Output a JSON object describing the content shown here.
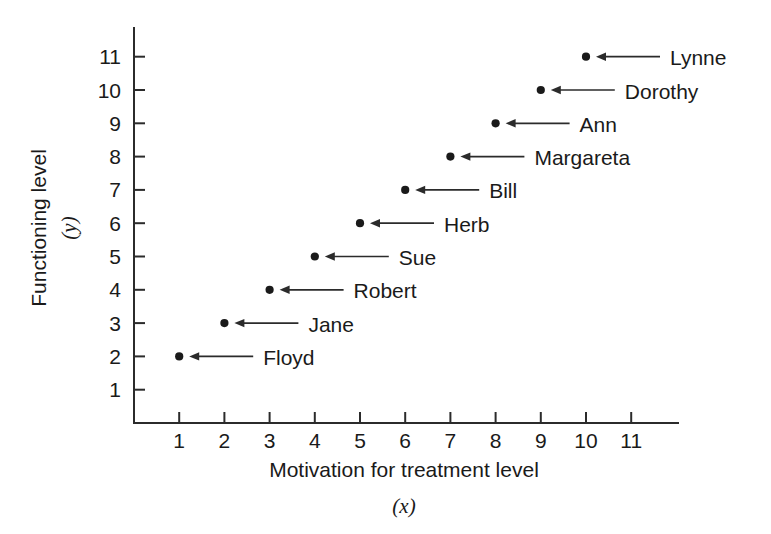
{
  "chart_data": {
    "type": "scatter",
    "title": "",
    "xlabel": "Motivation for treatment level",
    "xvar": "(x)",
    "ylabel": "Functioning level",
    "yvar": "(y)",
    "xlim": [
      0,
      11.8
    ],
    "ylim": [
      0,
      11.7
    ],
    "grid": false,
    "legend": "none",
    "xticks": [
      "1",
      "2",
      "3",
      "4",
      "5",
      "6",
      "7",
      "8",
      "9",
      "10",
      "11"
    ],
    "yticks": [
      "1",
      "2",
      "3",
      "4",
      "5",
      "6",
      "7",
      "8",
      "9",
      "10",
      "11"
    ],
    "x": [
      1,
      2,
      3,
      4,
      5,
      6,
      7,
      8,
      9,
      10
    ],
    "y": [
      2,
      3,
      4,
      5,
      6,
      7,
      8,
      9,
      10,
      11
    ],
    "point_labels": [
      "Floyd",
      "Jane",
      "Robert",
      "Sue",
      "Herb",
      "Bill",
      "Margareta",
      "Ann",
      "Dorothy",
      "Lynne"
    ],
    "points": [
      {
        "name": "Floyd",
        "x": 1,
        "y": 2
      },
      {
        "name": "Jane",
        "x": 2,
        "y": 3
      },
      {
        "name": "Robert",
        "x": 3,
        "y": 4
      },
      {
        "name": "Sue",
        "x": 4,
        "y": 5
      },
      {
        "name": "Herb",
        "x": 5,
        "y": 6
      },
      {
        "name": "Bill",
        "x": 6,
        "y": 7
      },
      {
        "name": "Margareta",
        "x": 7,
        "y": 8
      },
      {
        "name": "Ann",
        "x": 8,
        "y": 9
      },
      {
        "name": "Dorothy",
        "x": 9,
        "y": 10
      },
      {
        "name": "Lynne",
        "x": 10,
        "y": 11
      }
    ],
    "marker_color": "#1a1a1a",
    "axis_color": "#2b2b2b",
    "background_color": "#ffffff"
  }
}
